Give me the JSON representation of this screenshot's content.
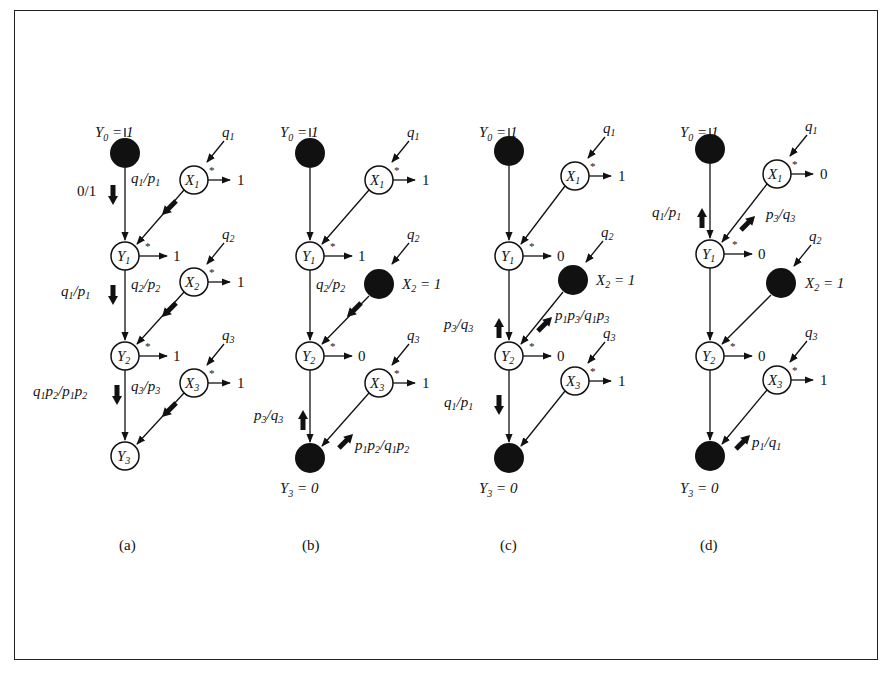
{
  "figure": {
    "panels": [
      {
        "id": "a",
        "caption": "(a)",
        "top_label": "Y0 = 1",
        "bottom_label": "",
        "nodes": {
          "Y0": {
            "state": "filled"
          },
          "Y1": {
            "state": "open",
            "label": "Y1",
            "output": "1"
          },
          "Y2": {
            "state": "open",
            "label": "Y2",
            "output": "1"
          },
          "Y3": {
            "state": "open",
            "label": "Y3"
          },
          "X1": {
            "state": "open",
            "label": "X1",
            "output": "1",
            "input": "q1"
          },
          "X2": {
            "state": "open",
            "label": "X2",
            "output": "1",
            "input": "q2"
          },
          "X3": {
            "state": "open",
            "label": "X3",
            "output": "1",
            "input": "q3"
          }
        },
        "flow_labels": [
          {
            "text": "0/1",
            "edge": "Y0-Y1",
            "direction": "down"
          },
          {
            "text": "q1/p1",
            "edge": "X1-Y1",
            "direction": "down-left"
          },
          {
            "text": "q1/p1",
            "edge": "Y1-Y2",
            "direction": "down"
          },
          {
            "text": "q2/p2",
            "edge": "X2-Y2",
            "direction": "down-left"
          },
          {
            "text": "q1p2/p1p2",
            "edge": "Y2-Y3",
            "direction": "down"
          },
          {
            "text": "q3/p3",
            "edge": "X3-Y3",
            "direction": "down-left"
          }
        ]
      },
      {
        "id": "b",
        "caption": "(b)",
        "top_label": "Y0 = 1",
        "bottom_label": "Y3 = 0",
        "nodes": {
          "Y0": {
            "state": "filled"
          },
          "Y1": {
            "state": "open",
            "label": "Y1",
            "output": "1"
          },
          "Y2": {
            "state": "open",
            "label": "Y2",
            "output": "0"
          },
          "Y3": {
            "state": "filled"
          },
          "X1": {
            "state": "open",
            "label": "X1",
            "output": "1",
            "input": "q1"
          },
          "X2": {
            "state": "filled",
            "evidence": "X2 = 1",
            "input": "q2"
          },
          "X3": {
            "state": "open",
            "label": "X3",
            "output": "1",
            "input": "q3"
          }
        },
        "flow_labels": [
          {
            "text": "q2/p2",
            "edge": "X2-Y2",
            "direction": "down-left"
          },
          {
            "text": "p3/q3",
            "edge": "Y2-Y3",
            "direction": "up"
          },
          {
            "text": "p1p2/q1p2",
            "edge": "X3-Y3",
            "direction": "up-right"
          }
        ]
      },
      {
        "id": "c",
        "caption": "(c)",
        "top_label": "Y0 = 1",
        "bottom_label": "Y3 = 0",
        "nodes": {
          "Y0": {
            "state": "filled"
          },
          "Y1": {
            "state": "open",
            "label": "Y1",
            "output": "0"
          },
          "Y2": {
            "state": "open",
            "label": "Y2",
            "output": "0"
          },
          "Y3": {
            "state": "filled"
          },
          "X1": {
            "state": "open",
            "label": "X1",
            "output": "1",
            "input": "q1"
          },
          "X2": {
            "state": "filled",
            "evidence": "X2 = 1",
            "input": "q2"
          },
          "X3": {
            "state": "open",
            "label": "X3",
            "output": "1",
            "input": "q3"
          }
        },
        "flow_labels": [
          {
            "text": "p3/q3",
            "edge": "Y1-Y2",
            "direction": "up"
          },
          {
            "text": "p1p3/q1p3",
            "edge": "X2-Y2",
            "direction": "up-right"
          },
          {
            "text": "q1/p1",
            "edge": "Y2-Y3",
            "direction": "down"
          }
        ]
      },
      {
        "id": "d",
        "caption": "(d)",
        "top_label": "Y0 = 1",
        "bottom_label": "Y3 = 0",
        "nodes": {
          "Y0": {
            "state": "filled"
          },
          "Y1": {
            "state": "open",
            "label": "Y1",
            "output": "0"
          },
          "Y2": {
            "state": "open",
            "label": "Y2",
            "output": "0"
          },
          "Y3": {
            "state": "filled"
          },
          "X1": {
            "state": "open",
            "label": "X1",
            "output": "0",
            "input": "q1"
          },
          "X2": {
            "state": "filled",
            "evidence": "X2 = 1",
            "input": "q2"
          },
          "X3": {
            "state": "open",
            "label": "X3",
            "output": "1",
            "input": "q3"
          }
        },
        "flow_labels": [
          {
            "text": "q1/p1",
            "edge": "Y0-Y1",
            "direction": "up"
          },
          {
            "text": "p3/q3",
            "edge": "X1-Y1",
            "direction": "up-right"
          },
          {
            "text": "p1/q1",
            "edge": "X3-Y3",
            "direction": "up-right"
          }
        ]
      }
    ]
  }
}
